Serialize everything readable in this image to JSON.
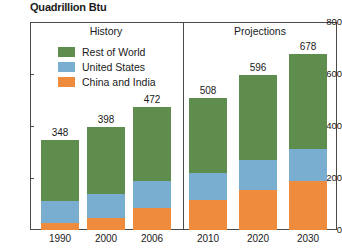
{
  "chart_data": {
    "type": "bar",
    "title": "Quadrillion Btu",
    "subtitle": "",
    "xlabel": "",
    "ylabel": "",
    "stacked": true,
    "grid": false,
    "legend_position": "upper-left-inside",
    "categories": [
      "1990",
      "2000",
      "2006",
      "2010",
      "2020",
      "2030"
    ],
    "ylim": [
      0,
      800
    ],
    "yticks": [
      0,
      200,
      400,
      600,
      800
    ],
    "ytick_labels": [
      "0",
      "200",
      "400",
      "600",
      "800"
    ],
    "series": [
      {
        "name": "China and India",
        "color": "#ef8b3c",
        "values": [
          25,
          45,
          85,
          115,
          155,
          190
        ]
      },
      {
        "name": "United States",
        "color": "#7aaed0",
        "values": [
          85,
          95,
          105,
          105,
          115,
          120
        ]
      },
      {
        "name": "Rest of World",
        "color": "#5e8d4e",
        "values": [
          238,
          258,
          282,
          288,
          326,
          368
        ]
      }
    ],
    "totals": [
      348,
      398,
      472,
      508,
      596,
      678
    ],
    "data_labels": [
      "348",
      "398",
      "472",
      "508",
      "596",
      "678"
    ],
    "panels": [
      {
        "label": "History",
        "categories": [
          "1990",
          "2000",
          "2006"
        ]
      },
      {
        "label": "Projections",
        "categories": [
          "2010",
          "2020",
          "2030"
        ]
      }
    ],
    "legend": [
      {
        "label": "Rest of World",
        "color": "#5e8d4e"
      },
      {
        "label": "United States",
        "color": "#7aaed0"
      },
      {
        "label": "China and India",
        "color": "#ef8b3c"
      }
    ]
  },
  "colors": {
    "rest_of_world": "#5e8d4e",
    "united_states": "#7aaed0",
    "china_and_india": "#ef8b3c",
    "axis": "#4a4a4a",
    "text": "#1a1a1a",
    "background": "#ffffff"
  }
}
